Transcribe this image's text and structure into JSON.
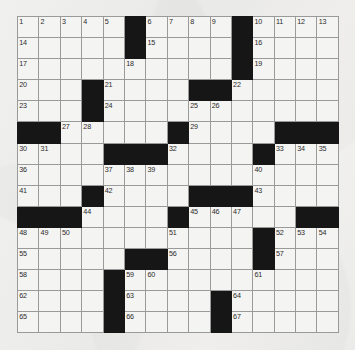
{
  "puzzle": {
    "kind": "crossword-grid",
    "rows": 15,
    "cols": 15,
    "colors": {
      "paper": "#f2f2f0",
      "cell_fill": "#f4f4f2",
      "block_fill": "#161616",
      "cell_border": "#9a9a9a",
      "outer_border": "#4a4a4a",
      "number_color": "#2b2b2b"
    },
    "highest_number": 67,
    "grid": [
      [
        {
          "n": "1",
          "b": false
        },
        {
          "n": "2",
          "b": false
        },
        {
          "n": "3",
          "b": false
        },
        {
          "n": "4",
          "b": false
        },
        {
          "n": "5",
          "b": false
        },
        {
          "n": "",
          "b": true
        },
        {
          "n": "6",
          "b": false
        },
        {
          "n": "7",
          "b": false
        },
        {
          "n": "8",
          "b": false
        },
        {
          "n": "9",
          "b": false
        },
        {
          "n": "",
          "b": true
        },
        {
          "n": "10",
          "b": false
        },
        {
          "n": "11",
          "b": false
        },
        {
          "n": "12",
          "b": false
        },
        {
          "n": "13",
          "b": false
        }
      ],
      [
        {
          "n": "14",
          "b": false
        },
        {
          "n": "",
          "b": false
        },
        {
          "n": "",
          "b": false
        },
        {
          "n": "",
          "b": false
        },
        {
          "n": "",
          "b": false
        },
        {
          "n": "",
          "b": true
        },
        {
          "n": "15",
          "b": false
        },
        {
          "n": "",
          "b": false
        },
        {
          "n": "",
          "b": false
        },
        {
          "n": "",
          "b": false
        },
        {
          "n": "",
          "b": true
        },
        {
          "n": "16",
          "b": false
        },
        {
          "n": "",
          "b": false
        },
        {
          "n": "",
          "b": false
        },
        {
          "n": "",
          "b": false
        }
      ],
      [
        {
          "n": "17",
          "b": false
        },
        {
          "n": "",
          "b": false
        },
        {
          "n": "",
          "b": false
        },
        {
          "n": "",
          "b": false
        },
        {
          "n": "",
          "b": false
        },
        {
          "n": "18",
          "b": false
        },
        {
          "n": "",
          "b": false
        },
        {
          "n": "",
          "b": false
        },
        {
          "n": "",
          "b": false
        },
        {
          "n": "",
          "b": false
        },
        {
          "n": "",
          "b": true
        },
        {
          "n": "19",
          "b": false
        },
        {
          "n": "",
          "b": false
        },
        {
          "n": "",
          "b": false
        },
        {
          "n": "",
          "b": false
        }
      ],
      [
        {
          "n": "20",
          "b": false
        },
        {
          "n": "",
          "b": false
        },
        {
          "n": "",
          "b": false
        },
        {
          "n": "",
          "b": true
        },
        {
          "n": "21",
          "b": false
        },
        {
          "n": "",
          "b": false
        },
        {
          "n": "",
          "b": false
        },
        {
          "n": "",
          "b": false
        },
        {
          "n": "",
          "b": true
        },
        {
          "n": "",
          "b": true
        },
        {
          "n": "22",
          "b": false
        },
        {
          "n": "",
          "b": false
        },
        {
          "n": "",
          "b": false
        },
        {
          "n": "",
          "b": false
        },
        {
          "n": "",
          "b": false
        }
      ],
      [
        {
          "n": "23",
          "b": false
        },
        {
          "n": "",
          "b": false
        },
        {
          "n": "",
          "b": false
        },
        {
          "n": "",
          "b": true
        },
        {
          "n": "24",
          "b": false
        },
        {
          "n": "",
          "b": false
        },
        {
          "n": "",
          "b": false
        },
        {
          "n": "",
          "b": false
        },
        {
          "n": "25",
          "b": false
        },
        {
          "n": "26",
          "b": false
        },
        {
          "n": "",
          "b": false
        },
        {
          "n": "",
          "b": false
        },
        {
          "n": "",
          "b": false
        },
        {
          "n": "",
          "b": false
        },
        {
          "n": "",
          "b": false
        }
      ],
      [
        {
          "n": "",
          "b": true
        },
        {
          "n": "",
          "b": true
        },
        {
          "n": "27",
          "b": false
        },
        {
          "n": "28",
          "b": false
        },
        {
          "n": "",
          "b": false
        },
        {
          "n": "",
          "b": false
        },
        {
          "n": "",
          "b": false
        },
        {
          "n": "",
          "b": true
        },
        {
          "n": "29",
          "b": false
        },
        {
          "n": "",
          "b": false
        },
        {
          "n": "",
          "b": false
        },
        {
          "n": "",
          "b": false
        },
        {
          "n": "",
          "b": true
        },
        {
          "n": "",
          "b": true
        },
        {
          "n": "",
          "b": true
        }
      ],
      [
        {
          "n": "30",
          "b": false
        },
        {
          "n": "31",
          "b": false
        },
        {
          "n": "",
          "b": false
        },
        {
          "n": "",
          "b": false
        },
        {
          "n": "",
          "b": true
        },
        {
          "n": "",
          "b": true
        },
        {
          "n": "",
          "b": true
        },
        {
          "n": "32",
          "b": false
        },
        {
          "n": "",
          "b": false
        },
        {
          "n": "",
          "b": false
        },
        {
          "n": "",
          "b": false
        },
        {
          "n": "",
          "b": true
        },
        {
          "n": "33",
          "b": false
        },
        {
          "n": "34",
          "b": false
        },
        {
          "n": "35",
          "b": false
        }
      ],
      [
        {
          "n": "36",
          "b": false
        },
        {
          "n": "",
          "b": false
        },
        {
          "n": "",
          "b": false
        },
        {
          "n": "",
          "b": false
        },
        {
          "n": "37",
          "b": false
        },
        {
          "n": "38",
          "b": false
        },
        {
          "n": "39",
          "b": false
        },
        {
          "n": "",
          "b": false
        },
        {
          "n": "",
          "b": false
        },
        {
          "n": "",
          "b": false
        },
        {
          "n": "",
          "b": false
        },
        {
          "n": "40",
          "b": false
        },
        {
          "n": "",
          "b": false
        },
        {
          "n": "",
          "b": false
        },
        {
          "n": "",
          "b": false
        }
      ],
      [
        {
          "n": "41",
          "b": false
        },
        {
          "n": "",
          "b": false
        },
        {
          "n": "",
          "b": false
        },
        {
          "n": "",
          "b": true
        },
        {
          "n": "42",
          "b": false
        },
        {
          "n": "",
          "b": false
        },
        {
          "n": "",
          "b": false
        },
        {
          "n": "",
          "b": false
        },
        {
          "n": "",
          "b": true
        },
        {
          "n": "",
          "b": true
        },
        {
          "n": "",
          "b": true
        },
        {
          "n": "43",
          "b": false
        },
        {
          "n": "",
          "b": false
        },
        {
          "n": "",
          "b": false
        },
        {
          "n": "",
          "b": false
        }
      ],
      [
        {
          "n": "",
          "b": true
        },
        {
          "n": "",
          "b": true
        },
        {
          "n": "",
          "b": true
        },
        {
          "n": "44",
          "b": false
        },
        {
          "n": "",
          "b": false
        },
        {
          "n": "",
          "b": false
        },
        {
          "n": "",
          "b": false
        },
        {
          "n": "",
          "b": true
        },
        {
          "n": "45",
          "b": false
        },
        {
          "n": "46",
          "b": false
        },
        {
          "n": "47",
          "b": false
        },
        {
          "n": "",
          "b": false
        },
        {
          "n": "",
          "b": false
        },
        {
          "n": "",
          "b": true
        },
        {
          "n": "",
          "b": true
        }
      ],
      [
        {
          "n": "48",
          "b": false
        },
        {
          "n": "49",
          "b": false
        },
        {
          "n": "50",
          "b": false
        },
        {
          "n": "",
          "b": false
        },
        {
          "n": "",
          "b": false
        },
        {
          "n": "",
          "b": false
        },
        {
          "n": "",
          "b": false
        },
        {
          "n": "51",
          "b": false
        },
        {
          "n": "",
          "b": false
        },
        {
          "n": "",
          "b": false
        },
        {
          "n": "",
          "b": false
        },
        {
          "n": "",
          "b": true
        },
        {
          "n": "52",
          "b": false
        },
        {
          "n": "53",
          "b": false
        },
        {
          "n": "54",
          "b": false
        }
      ],
      [
        {
          "n": "55",
          "b": false
        },
        {
          "n": "",
          "b": false
        },
        {
          "n": "",
          "b": false
        },
        {
          "n": "",
          "b": false
        },
        {
          "n": "",
          "b": false
        },
        {
          "n": "",
          "b": true
        },
        {
          "n": "",
          "b": true
        },
        {
          "n": "56",
          "b": false
        },
        {
          "n": "",
          "b": false
        },
        {
          "n": "",
          "b": false
        },
        {
          "n": "",
          "b": false
        },
        {
          "n": "",
          "b": true
        },
        {
          "n": "57",
          "b": false
        },
        {
          "n": "",
          "b": false
        },
        {
          "n": "",
          "b": false
        }
      ],
      [
        {
          "n": "58",
          "b": false
        },
        {
          "n": "",
          "b": false
        },
        {
          "n": "",
          "b": false
        },
        {
          "n": "",
          "b": false
        },
        {
          "n": "",
          "b": true
        },
        {
          "n": "59",
          "b": false
        },
        {
          "n": "60",
          "b": false
        },
        {
          "n": "",
          "b": false
        },
        {
          "n": "",
          "b": false
        },
        {
          "n": "",
          "b": false
        },
        {
          "n": "",
          "b": false
        },
        {
          "n": "61",
          "b": false
        },
        {
          "n": "",
          "b": false
        },
        {
          "n": "",
          "b": false
        },
        {
          "n": "",
          "b": false
        }
      ],
      [
        {
          "n": "62",
          "b": false
        },
        {
          "n": "",
          "b": false
        },
        {
          "n": "",
          "b": false
        },
        {
          "n": "",
          "b": false
        },
        {
          "n": "",
          "b": true
        },
        {
          "n": "63",
          "b": false
        },
        {
          "n": "",
          "b": false
        },
        {
          "n": "",
          "b": false
        },
        {
          "n": "",
          "b": false
        },
        {
          "n": "",
          "b": true
        },
        {
          "n": "64",
          "b": false
        },
        {
          "n": "",
          "b": false
        },
        {
          "n": "",
          "b": false
        },
        {
          "n": "",
          "b": false
        },
        {
          "n": "",
          "b": false
        }
      ],
      [
        {
          "n": "65",
          "b": false
        },
        {
          "n": "",
          "b": false
        },
        {
          "n": "",
          "b": false
        },
        {
          "n": "",
          "b": false
        },
        {
          "n": "",
          "b": true
        },
        {
          "n": "66",
          "b": false
        },
        {
          "n": "",
          "b": false
        },
        {
          "n": "",
          "b": false
        },
        {
          "n": "",
          "b": false
        },
        {
          "n": "",
          "b": true
        },
        {
          "n": "67",
          "b": false
        },
        {
          "n": "",
          "b": false
        },
        {
          "n": "",
          "b": false
        },
        {
          "n": "",
          "b": false
        },
        {
          "n": "",
          "b": false
        }
      ]
    ]
  }
}
